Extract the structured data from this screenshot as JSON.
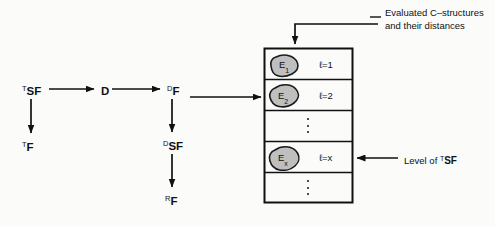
{
  "figure": {
    "background_color": "#fbfbfa",
    "ink_color": "#111111",
    "blob_fill_color": "#bfbfbf",
    "blob_stroke_color": "#1a1a1a"
  },
  "flow_nodes": [
    {
      "id": "t-sf",
      "sup": "T",
      "base": "SF",
      "x": 22,
      "y": 84
    },
    {
      "id": "d",
      "sup": "",
      "base": "D",
      "x": 101,
      "y": 86
    },
    {
      "id": "d-f",
      "sup": "D",
      "base": "F",
      "x": 167,
      "y": 84
    },
    {
      "id": "t-f",
      "sup": "T",
      "base": "F",
      "x": 22,
      "y": 140
    },
    {
      "id": "d-sf",
      "sup": "D",
      "base": "SF",
      "x": 163,
      "y": 139
    },
    {
      "id": "r-f",
      "sup": "R",
      "base": "F",
      "x": 165,
      "y": 194
    }
  ],
  "table": {
    "left": 264,
    "top": 48,
    "width": 89,
    "height": 155,
    "rows": [
      {
        "kind": "entry",
        "blob": "E",
        "sub": "1",
        "level_label": "ℓ=1"
      },
      {
        "kind": "entry",
        "blob": "E",
        "sub": "2",
        "level_label": "ℓ=2"
      },
      {
        "kind": "dots",
        "blob": "",
        "sub": "",
        "level_label": ""
      },
      {
        "kind": "entry",
        "blob": "E",
        "sub": "x",
        "level_label": "ℓ=x"
      },
      {
        "kind": "dots",
        "blob": "",
        "sub": "",
        "level_label": ""
      }
    ]
  },
  "annotations": [
    {
      "id": "evaluated-structures",
      "line1": "Evaluated C–structures",
      "line2": "and their distances",
      "x": 385,
      "y": 7
    }
  ],
  "level_annotation": {
    "id": "level-of-tsf",
    "prefix": "Level of ",
    "sup": "T",
    "base": "SF",
    "x": 404,
    "y": 152
  }
}
